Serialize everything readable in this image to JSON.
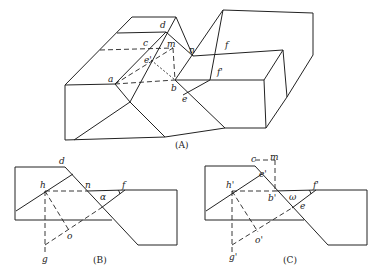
{
  "figure_a": {
    "caption": "(A)",
    "labels": {
      "a": "a",
      "b": "b",
      "c": "c",
      "d": "d",
      "m": "m",
      "n": "n",
      "e_prime": "e'",
      "e": "e",
      "f": "f",
      "f_prime": "f'"
    }
  },
  "figure_b": {
    "caption": "(B)",
    "labels": {
      "d": "d",
      "h": "h",
      "n": "n",
      "alpha": "α",
      "f": "f",
      "g": "g",
      "o": "o"
    }
  },
  "figure_c": {
    "caption": "(C)",
    "labels": {
      "c": "c",
      "m": "m",
      "e_prime": "e'",
      "h_prime": "h'",
      "b_prime": "b'",
      "omega": "ω",
      "f_prime": "f'",
      "e": "e",
      "o_prime": "o'",
      "g_prime": "g'"
    }
  }
}
